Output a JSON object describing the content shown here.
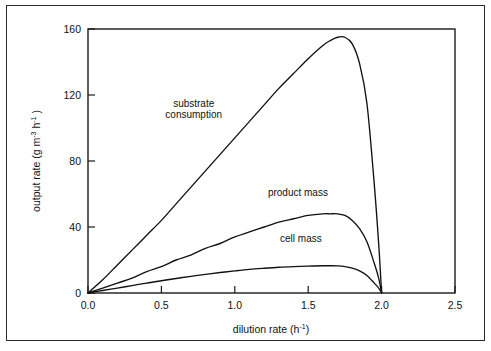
{
  "figure": {
    "background_color": "#ffffff",
    "frame_color": "#2a2a2a",
    "line_color": "#111111"
  },
  "axes": {
    "x_title_main": "dilution rate",
    "x_title_units_open": "(h",
    "x_title_units_exp": "-1",
    "x_title_units_close": ")",
    "y_title_main": "output rate",
    "y_title_units_open": "(g m",
    "y_title_units_exp1": "-3",
    "y_title_units_mid": " h",
    "y_title_units_exp2": "-1",
    "y_title_units_close": " )",
    "x_ticks": [
      "0.0",
      "0.5",
      "1.0",
      "1.5",
      "2.0",
      "2.5"
    ],
    "y_ticks": [
      "0",
      "40",
      "80",
      "120",
      "160"
    ]
  },
  "series_labels": {
    "substrate_line1": "substrate",
    "substrate_line2": "consumption",
    "product": "product  mass",
    "cell": "cell  mass"
  },
  "chart_data": {
    "type": "line",
    "title": "",
    "xlabel": "dilution rate (h^-1)",
    "ylabel": "output rate (g m^-3 h^-1)",
    "xlim": [
      0.0,
      2.5
    ],
    "ylim": [
      0,
      160
    ],
    "xticks": [
      0.0,
      0.5,
      1.0,
      1.5,
      2.0,
      2.5
    ],
    "yticks": [
      0,
      40,
      80,
      120,
      160
    ],
    "grid": false,
    "legend": "inline-annotations",
    "washout_dilution_rate": 2.0,
    "series": [
      {
        "name": "substrate consumption",
        "label_position": {
          "x": 0.72,
          "y": 113
        },
        "x": [
          0.0,
          0.1,
          0.2,
          0.3,
          0.4,
          0.5,
          0.6,
          0.7,
          0.8,
          0.9,
          1.0,
          1.1,
          1.2,
          1.3,
          1.4,
          1.5,
          1.6,
          1.65,
          1.7,
          1.75,
          1.8,
          1.85,
          1.9,
          1.95,
          1.98,
          2.0
        ],
        "values": [
          0,
          8,
          17,
          26,
          35,
          44,
          54,
          64,
          74,
          84,
          94,
          104,
          114,
          124,
          133,
          142,
          150,
          153,
          155,
          155,
          151,
          139,
          115,
          66,
          30,
          0
        ]
      },
      {
        "name": "product mass",
        "label_position": {
          "x": 1.43,
          "y": 59
        },
        "x": [
          0.0,
          0.1,
          0.2,
          0.3,
          0.4,
          0.5,
          0.6,
          0.7,
          0.8,
          0.9,
          1.0,
          1.1,
          1.2,
          1.3,
          1.4,
          1.5,
          1.6,
          1.65,
          1.7,
          1.75,
          1.8,
          1.85,
          1.9,
          1.95,
          1.98,
          2.0
        ],
        "values": [
          0,
          3,
          6,
          9,
          13,
          16,
          20,
          23,
          27,
          30,
          34,
          37,
          40,
          43,
          45,
          47,
          48,
          48,
          48,
          47,
          44,
          39,
          31,
          18,
          9,
          0
        ]
      },
      {
        "name": "cell mass",
        "label_position": {
          "x": 1.45,
          "y": 31
        },
        "x": [
          0.0,
          0.1,
          0.2,
          0.3,
          0.4,
          0.5,
          0.6,
          0.7,
          0.8,
          0.9,
          1.0,
          1.1,
          1.2,
          1.3,
          1.4,
          1.5,
          1.6,
          1.65,
          1.7,
          1.75,
          1.8,
          1.85,
          1.9,
          1.95,
          1.98,
          2.0
        ],
        "values": [
          0,
          1.5,
          3,
          4.5,
          6,
          7.4,
          8.8,
          10.1,
          11.3,
          12.4,
          13.4,
          14.3,
          15.0,
          15.6,
          16.0,
          16.3,
          16.5,
          16.5,
          16.4,
          16.0,
          15.1,
          13.4,
          10.6,
          6.0,
          3.0,
          0
        ]
      }
    ]
  }
}
